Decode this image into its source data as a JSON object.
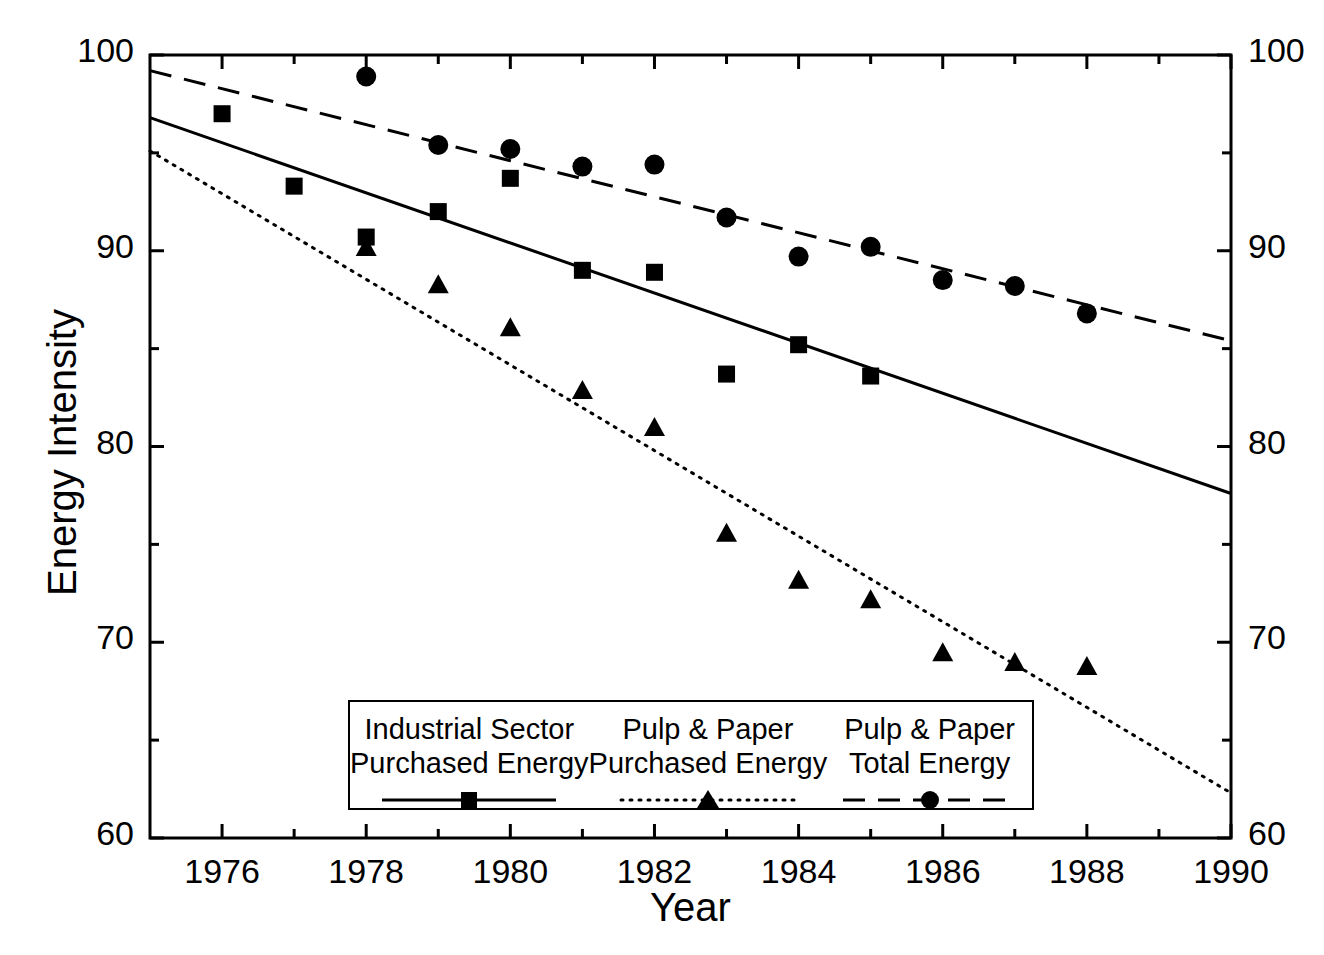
{
  "chart_data": {
    "type": "scatter",
    "title": "",
    "xlabel": "Year",
    "ylabel": "Energy Intensity",
    "xlim": [
      1975,
      1990
    ],
    "ylim": [
      60,
      100
    ],
    "grid": false,
    "legend_position": "bottom-center",
    "x_ticks_major": [
      1976,
      1978,
      1980,
      1982,
      1984,
      1986,
      1988,
      1990
    ],
    "x_ticks_minor": [
      1975,
      1977,
      1979,
      1981,
      1983,
      1985,
      1987,
      1989
    ],
    "y_ticks_major": [
      60,
      70,
      80,
      90,
      100
    ],
    "y_ticks_minor": [
      65,
      75,
      85,
      95
    ],
    "x_tick_labels": [
      "1976",
      "1978",
      "1980",
      "1982",
      "1984",
      "1986",
      "1988",
      "1990"
    ],
    "y_tick_labels_left": [
      "100",
      "90",
      "80",
      "70",
      "60"
    ],
    "y_tick_labels_right": [
      "100",
      "90",
      "80",
      "70",
      "60"
    ],
    "series": [
      {
        "name": "Industrial Sector Purchased Energy",
        "marker": "square",
        "line_style": "solid",
        "color": "#000000",
        "x": [
          1976,
          1977,
          1978,
          1979,
          1980,
          1981,
          1982,
          1983,
          1984,
          1985
        ],
        "values": [
          97.0,
          93.3,
          90.7,
          92.0,
          93.7,
          89.0,
          88.9,
          83.7,
          85.2,
          83.6
        ],
        "trend": {
          "x0": 1975,
          "y0": 96.8,
          "x1": 1990,
          "y1": 77.6
        }
      },
      {
        "name": "Pulp & Paper Purchased Energy",
        "marker": "triangle",
        "line_style": "dotted",
        "color": "#000000",
        "x": [
          1978,
          1979,
          1980,
          1981,
          1982,
          1983,
          1984,
          1985,
          1986,
          1987,
          1988
        ],
        "values": [
          90.1,
          88.2,
          86.0,
          82.8,
          80.9,
          75.5,
          73.1,
          72.1,
          69.4,
          68.9,
          68.7
        ],
        "trend": {
          "x0": 1975,
          "y0": 95.1,
          "x1": 1990,
          "y1": 62.3
        }
      },
      {
        "name": "Pulp & Paper Total Energy",
        "marker": "circle",
        "line_style": "dashed",
        "color": "#000000",
        "x": [
          1978,
          1979,
          1980,
          1981,
          1982,
          1983,
          1984,
          1985,
          1986,
          1987,
          1988
        ],
        "values": [
          98.9,
          95.4,
          95.2,
          94.3,
          94.4,
          91.7,
          89.7,
          90.2,
          88.5,
          88.2,
          86.8
        ],
        "trend": {
          "x0": 1975,
          "y0": 99.2,
          "x1": 1990,
          "y1": 85.4
        }
      }
    ]
  },
  "axes": {
    "ylabel": "Energy Intensity",
    "xlabel": "Year",
    "y_left": [
      "100",
      "90",
      "80",
      "70",
      "60"
    ],
    "y_right": [
      "100",
      "90",
      "80",
      "70",
      "60"
    ],
    "x": [
      "1976",
      "1978",
      "1980",
      "1982",
      "1984",
      "1986",
      "1988",
      "1990"
    ]
  },
  "legend": {
    "entries": [
      {
        "line1": "Industrial Sector",
        "line2": "Purchased Energy",
        "marker": "square",
        "line_style": "solid"
      },
      {
        "line1": "Pulp & Paper",
        "line2": "Purchased Energy",
        "marker": "triangle",
        "line_style": "dotted"
      },
      {
        "line1": "Pulp & Paper",
        "line2": "Total Energy",
        "marker": "circle",
        "line_style": "dashed"
      }
    ]
  }
}
